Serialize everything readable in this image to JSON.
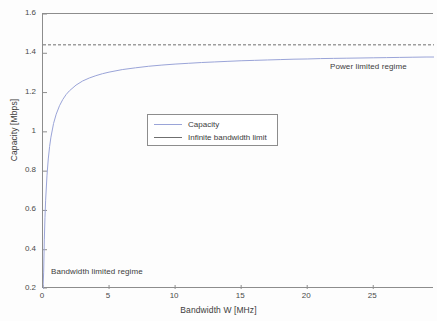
{
  "chart_data": {
    "type": "line",
    "title": "",
    "xlabel": "Bandwidth W [MHz]",
    "ylabel": "Capacity [Mbps]",
    "xlim": [
      0,
      29.6
    ],
    "ylim": [
      0.2,
      1.6
    ],
    "xticks": [
      0,
      5,
      10,
      15,
      20,
      25
    ],
    "xtick_labels": [
      "0",
      "5",
      "10",
      "15",
      "20",
      "25"
    ],
    "yticks": [
      0.2,
      0.4,
      0.6,
      0.8,
      1,
      1.2,
      1.4,
      1.6
    ],
    "ytick_labels": [
      "0.2",
      "0.4",
      "0.6",
      "0.8",
      "1",
      "1.2",
      "1.4",
      "1.6"
    ],
    "grid": false,
    "legend_position": "center",
    "series": [
      {
        "name": "Capacity",
        "color": "#9aa4d8",
        "style": "solid",
        "x": [
          0.0,
          0.05,
          0.1,
          0.15,
          0.2,
          0.3,
          0.4,
          0.5,
          0.6,
          0.8,
          1.0,
          1.25,
          1.5,
          1.75,
          2.0,
          2.5,
          3.0,
          3.5,
          4.0,
          4.5,
          5.0,
          6.0,
          7.0,
          8.0,
          9.0,
          10.0,
          11.0,
          12.0,
          13.0,
          14.0,
          15.0,
          16.0,
          17.0,
          18.0,
          19.0,
          20.0,
          21.0,
          22.0,
          23.0,
          24.0,
          25.0,
          26.0,
          27.0,
          28.0,
          29.0,
          29.6
        ],
        "y": [
          0.2,
          0.286,
          0.45,
          0.565,
          0.652,
          0.776,
          0.862,
          0.925,
          0.973,
          1.043,
          1.09,
          1.133,
          1.165,
          1.19,
          1.209,
          1.238,
          1.259,
          1.274,
          1.286,
          1.296,
          1.304,
          1.317,
          1.326,
          1.334,
          1.34,
          1.345,
          1.349,
          1.353,
          1.356,
          1.359,
          1.362,
          1.364,
          1.366,
          1.368,
          1.37,
          1.371,
          1.373,
          1.374,
          1.375,
          1.376,
          1.377,
          1.378,
          1.379,
          1.38,
          1.381,
          1.381
        ]
      },
      {
        "name": "Infinite bandwidth limit",
        "color": "#6f6f6f",
        "style": "dashed",
        "value": 1.443,
        "x": [
          0,
          29.6
        ],
        "y": [
          1.443,
          1.443
        ]
      }
    ],
    "annotations": [
      {
        "text": "Power limited regime",
        "x": 22.0,
        "y": 1.31
      },
      {
        "text": "Bandwidth limited regime",
        "x": 0.7,
        "y": 0.27
      }
    ]
  },
  "legend": {
    "items": [
      {
        "label": "Capacity"
      },
      {
        "label": "Infinite bandwidth limit"
      }
    ]
  },
  "axis": {
    "x_title": "Bandwidth W [MHz]",
    "y_title": "Capacity [Mbps]"
  },
  "annotations": {
    "power_limited": "Power limited regime",
    "bandwidth_limited": "Bandwidth limited regime"
  },
  "colors": {
    "capacity_line": "#9aa4d8",
    "limit_line": "#6f6f6f",
    "axis": "#8d8d8d",
    "text": "#3c3c3c",
    "background": "#fdfdfd"
  }
}
